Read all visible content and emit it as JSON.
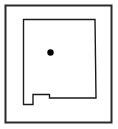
{
  "figure": {
    "name": "state-locator-map",
    "width": 118,
    "height": 129,
    "background_color": "#ffffff"
  },
  "frame": {
    "name": "map-frame",
    "stroke_color": "#2b2b2b",
    "stroke_width": 2,
    "fill_color": "#ffffff",
    "x": 5.5,
    "y": 5.5,
    "width": 106,
    "height": 117
  },
  "state_outline": {
    "name": "new-mexico-outline",
    "label": "New Mexico",
    "stroke_color": "#1a1a1a",
    "stroke_width": 1.4,
    "fill_color": "#ffffff",
    "points": "23.5,19.5 95.0,19.5 96.0,98.0 49.5,98.0 49.5,94.5 33.0,94.5 33.0,104.5 23.5,104.5"
  },
  "marker": {
    "name": "location-dot",
    "color": "#000000",
    "cx": 50.5,
    "cy": 52.5,
    "r": 3.2
  }
}
